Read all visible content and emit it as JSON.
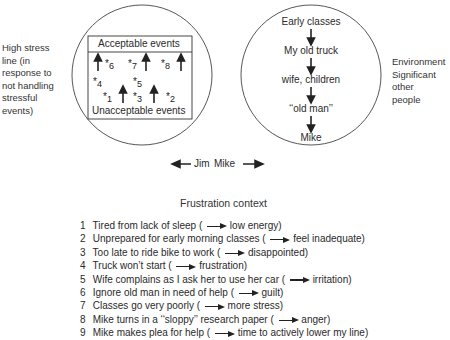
{
  "left_side_label": [
    "High stress",
    "line (in",
    "response to",
    "not handling",
    "stressful",
    "events)"
  ],
  "right_side_label": [
    "Environment",
    "Significant",
    "other",
    "people"
  ],
  "jim_circle": {
    "top_label": "Acceptable events",
    "bottom_label": "Unacceptable events",
    "events": [
      {
        "id": "6",
        "star": "*",
        "num": "6"
      },
      {
        "id": "7",
        "star": "*",
        "num": "7"
      },
      {
        "id": "8",
        "star": "*",
        "num": "8"
      },
      {
        "id": "4",
        "star": "*",
        "num": "4"
      },
      {
        "id": "5",
        "star": "*",
        "num": "5"
      },
      {
        "id": "1",
        "star": "*",
        "num": "1"
      },
      {
        "id": "3",
        "star": "*",
        "num": "3"
      },
      {
        "id": "2",
        "star": "*",
        "num": "2"
      }
    ]
  },
  "mike_circle": {
    "chain": [
      "Early classes",
      "My old truck",
      "wife, children",
      "‘‘old man’’",
      "Mike"
    ]
  },
  "pointers": {
    "jim": "Jim",
    "mike": "Mike"
  },
  "frustration": {
    "title": "Frustration context",
    "items": [
      {
        "num": "1",
        "cause": "Tired from lack of sleep (",
        "effect": "low energy)"
      },
      {
        "num": "2",
        "cause": "Unprepared for early morning classes (",
        "effect": "feel inadequate)"
      },
      {
        "num": "3",
        "cause": "Too late to ride bike to work (",
        "effect": "disappointed)"
      },
      {
        "num": "4",
        "cause": "Truck won’t start (",
        "effect": "frustration)"
      },
      {
        "num": "5",
        "cause": "Wife complains as I ask her to use her car (",
        "effect": "irritation)"
      },
      {
        "num": "6",
        "cause": "Ignore old man in need of help (",
        "effect": "guilt)"
      },
      {
        "num": "7",
        "cause": "Classes go very poorly (",
        "effect": "more stress)"
      },
      {
        "num": "8",
        "cause": "Mike turns in a ‘‘sloppy’’ research paper (",
        "effect": "anger)"
      },
      {
        "num": "9",
        "cause": "Mike makes plea for help (",
        "effect": "time to actively lower my line)"
      }
    ]
  }
}
